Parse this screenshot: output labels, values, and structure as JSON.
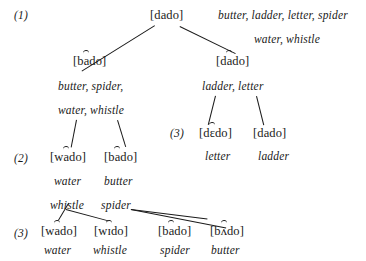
{
  "figure": {
    "type": "linguistic-derivation-tree",
    "stages": [
      {
        "id": "stage-1-top",
        "label": "(1)"
      },
      {
        "id": "stage-3-right",
        "label": "(3)"
      },
      {
        "id": "stage-2-left",
        "label": "(2)"
      },
      {
        "id": "stage-3-bottom",
        "label": "(3)"
      }
    ],
    "nodes": {
      "root": {
        "phon_pre": "[d",
        "phon_flap": "a",
        "phon_post": "do]",
        "flap": false
      },
      "left_l2": {
        "phon_pre": "[b",
        "phon_flap": "a",
        "phon_post": "do]",
        "flap": true
      },
      "right_l2": {
        "phon_pre": "[d",
        "phon_flap": "a",
        "phon_post": "do]",
        "flap": true
      },
      "dedo": {
        "phon_pre": "[d",
        "phon_flap": "ɛ",
        "phon_post": "do]",
        "flap": true
      },
      "dado_r3": {
        "phon_pre": "[d",
        "phon_flap": "a",
        "phon_post": "do]",
        "flap": false
      },
      "wado_l2": {
        "phon_pre": "[w",
        "phon_flap": "a",
        "phon_post": "do]",
        "flap": true
      },
      "bado_l2": {
        "phon_pre": "[b",
        "phon_flap": "a",
        "phon_post": "do]",
        "flap": true
      },
      "wado_b3": {
        "phon_pre": "[w",
        "phon_flap": "a",
        "phon_post": "do]",
        "flap": true
      },
      "wido_b3": {
        "phon_pre": "[w",
        "phon_flap": "ɪ",
        "phon_post": "do]",
        "flap": true
      },
      "bado_b3": {
        "phon_pre": "[b",
        "phon_flap": "a",
        "phon_post": "do]",
        "flap": true
      },
      "bado_b3_v": {
        "phon_pre": "[b",
        "phon_flap": "ʌ",
        "phon_post": "do]",
        "flap": true
      }
    },
    "glosses": {
      "root_line1": "butter, ladder, letter, spider",
      "root_line2": "water, whistle",
      "left_line1": "butter, spider,",
      "left_line2": "water, whistle",
      "right_line1": "ladder, letter",
      "dedo_gloss": "letter",
      "dado_r3_gloss": "ladder",
      "wado_l2_gloss": "water",
      "bado_l2_gloss": "butter",
      "whistle_label": "whistle",
      "spider_label": "spider",
      "wado_b3_gloss": "water",
      "wido_b3_gloss": "whistle",
      "bado_b3_gloss": "spider",
      "bado_b3_v_gloss": "butter"
    }
  }
}
